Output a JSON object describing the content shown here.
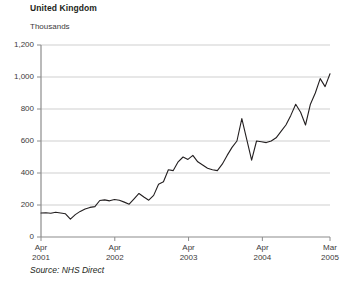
{
  "chart_data": {
    "type": "line",
    "title": "United Kingdom",
    "subtitle": "Thousands",
    "ylabel": "Thousands",
    "xlabel": "",
    "source": "Source: NHS Direct",
    "grid": true,
    "legend": "none",
    "ylim": [
      0,
      1200
    ],
    "y_ticks": [
      0,
      200,
      400,
      600,
      800,
      1000,
      1200
    ],
    "y_tick_labels": [
      "0",
      "200",
      "400",
      "600",
      "800",
      "1,000",
      "1,200"
    ],
    "x_ticks": [
      0,
      12,
      24,
      36,
      47
    ],
    "x_tick_labels": [
      {
        "month": "Apr",
        "year": "2001"
      },
      {
        "month": "Apr",
        "year": "2002"
      },
      {
        "month": "Apr",
        "year": "2003"
      },
      {
        "month": "Apr",
        "year": "2004"
      },
      {
        "month": "Mar",
        "year": "2005"
      }
    ],
    "xlim": [
      0,
      47
    ],
    "line_color": "#231f20",
    "grid_color": "#c9c9c9",
    "axis_color": "#8c8c8c",
    "series": [
      {
        "name": "NHS Direct calls",
        "x": [
          0,
          1,
          2,
          3,
          4,
          5,
          6,
          7,
          8,
          9,
          10,
          11,
          12,
          13,
          14,
          15,
          16,
          17,
          18,
          19,
          20,
          21,
          22,
          23,
          24,
          25,
          26,
          27,
          28,
          29,
          30,
          31,
          32,
          33,
          34,
          35,
          36,
          37,
          38,
          39,
          40,
          41,
          42,
          43,
          44,
          45,
          46,
          47
        ],
        "values": [
          150,
          152,
          148,
          155,
          150,
          145,
          112,
          140,
          160,
          175,
          185,
          190,
          228,
          232,
          226,
          234,
          230,
          218,
          205,
          238,
          272,
          250,
          230,
          260,
          330,
          345,
          420,
          415,
          470,
          500,
          485,
          510,
          470,
          450,
          430,
          420,
          415,
          455,
          510,
          560,
          600,
          740,
          610,
          480,
          600,
          595,
          590,
          600
        ]
      },
      {
        "name": "NHS Direct calls (continued)",
        "x": [
          47,
          48,
          49,
          50,
          51,
          52,
          53,
          54,
          55,
          56,
          57,
          58,
          59
        ],
        "values": [
          600,
          620,
          660,
          700,
          760,
          830,
          780,
          700,
          830,
          900,
          990,
          940,
          1020
        ]
      }
    ],
    "data_points": [
      {
        "label": "Apr 2001",
        "value": 150
      },
      {
        "label": "Oct 2001",
        "value": 112
      },
      {
        "label": "Apr 2002",
        "value": 228
      },
      {
        "label": "Apr 2003",
        "value": 330
      },
      {
        "label": "Dec 2003",
        "value": 510
      },
      {
        "label": "Apr 2004",
        "value": 415
      },
      {
        "label": "Aug 2004 peak",
        "value": 740
      },
      {
        "label": "Sep 2004 trough",
        "value": 480
      },
      {
        "label": "Mar 2005",
        "value": 1020
      }
    ]
  },
  "plot_geometry": {
    "left": 41,
    "right": 330,
    "top": 45,
    "bottom": 237
  }
}
